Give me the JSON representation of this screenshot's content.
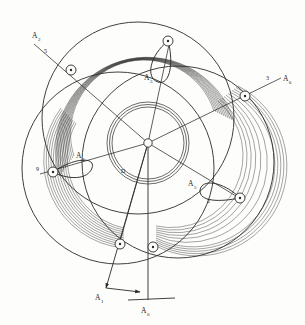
{
  "figure": {
    "background_color": "#fdfdfb",
    "ink_color": "#2b2b2b",
    "width": 305,
    "height": 325,
    "center": {
      "x": 148,
      "y": 143
    }
  },
  "hub": {
    "name": "central-hub",
    "radius": 4.2,
    "inner_ring_radii": [
      36,
      38.5,
      41
    ],
    "inner_ring_label": "D"
  },
  "bands": {
    "description": "hatched concentric arc bands forming three overlapping rings",
    "arc_count_per_band": 11,
    "inner_radius": 72,
    "outer_radius": 88
  },
  "outer_circles": [
    {
      "name": "outer-circle-top",
      "cx": 138,
      "cy": 118,
      "r": 96
    },
    {
      "name": "outer-circle-lower-left",
      "cx": 118,
      "cy": 168,
      "r": 96
    },
    {
      "name": "outer-circle-lower-right",
      "cx": 178,
      "cy": 162,
      "r": 96
    }
  ],
  "nodes": [
    {
      "id": "n1",
      "label": "",
      "x": 71,
      "y": 70
    },
    {
      "id": "n2",
      "label": "",
      "x": 168,
      "y": 41
    },
    {
      "id": "n3",
      "label": "",
      "x": 245,
      "y": 96
    },
    {
      "id": "n4",
      "label": "",
      "x": 240,
      "y": 198
    },
    {
      "id": "n5",
      "label": "",
      "x": 153,
      "y": 247
    },
    {
      "id": "n6",
      "label": "",
      "x": 120,
      "y": 244
    },
    {
      "id": "n7",
      "label": "",
      "x": 53,
      "y": 172
    }
  ],
  "loops": [
    {
      "id": "loop-top",
      "label": "A",
      "sub": "3",
      "label_x": 146,
      "label_y": 79
    },
    {
      "id": "loop-left",
      "label": "A",
      "sub": "4",
      "label_x": 78,
      "label_y": 157
    },
    {
      "id": "loop-right",
      "label": "A",
      "sub": "5",
      "label_x": 190,
      "label_y": 185
    }
  ],
  "labels": [
    {
      "id": "lbl-upper-left",
      "text": "A",
      "sub": "2",
      "x": 32,
      "y": 38
    },
    {
      "id": "lbl-upper-left-index",
      "text": "5",
      "x": 44,
      "y": 53
    },
    {
      "id": "lbl-right",
      "text": "A",
      "sub": "6",
      "x": 283,
      "y": 81
    },
    {
      "id": "lbl-right-index",
      "text": "3",
      "x": 268,
      "y": 80
    },
    {
      "id": "lbl-bottom-left",
      "text": "A",
      "sub": "1",
      "x": 98,
      "y": 299
    },
    {
      "id": "lbl-bottom-center",
      "text": "A",
      "sub": "0",
      "x": 144,
      "y": 311
    },
    {
      "id": "lbl-left-node",
      "text": "9",
      "x": 36,
      "y": 171
    },
    {
      "id": "lbl-right-loop-index",
      "text": "2",
      "x": 208,
      "y": 203
    },
    {
      "id": "lbl-inner-ring",
      "text": "D",
      "x": 123,
      "y": 172
    }
  ],
  "axes": [
    {
      "id": "axis-bottom-center",
      "name": "vertical-axis-arrow",
      "x1": 148,
      "y1": 143,
      "x2": 148,
      "y2": 300
    },
    {
      "id": "axis-bottom-left",
      "name": "diagonal-axis-arrow",
      "x1": 148,
      "y1": 143,
      "x2": 105,
      "y2": 289
    },
    {
      "id": "axis-upper-left",
      "name": "upper-left-axis",
      "x1": 148,
      "y1": 143,
      "x2": 34,
      "y2": 44
    },
    {
      "id": "axis-right",
      "name": "right-axis",
      "x1": 148,
      "y1": 143,
      "x2": 281,
      "y2": 78
    }
  ]
}
